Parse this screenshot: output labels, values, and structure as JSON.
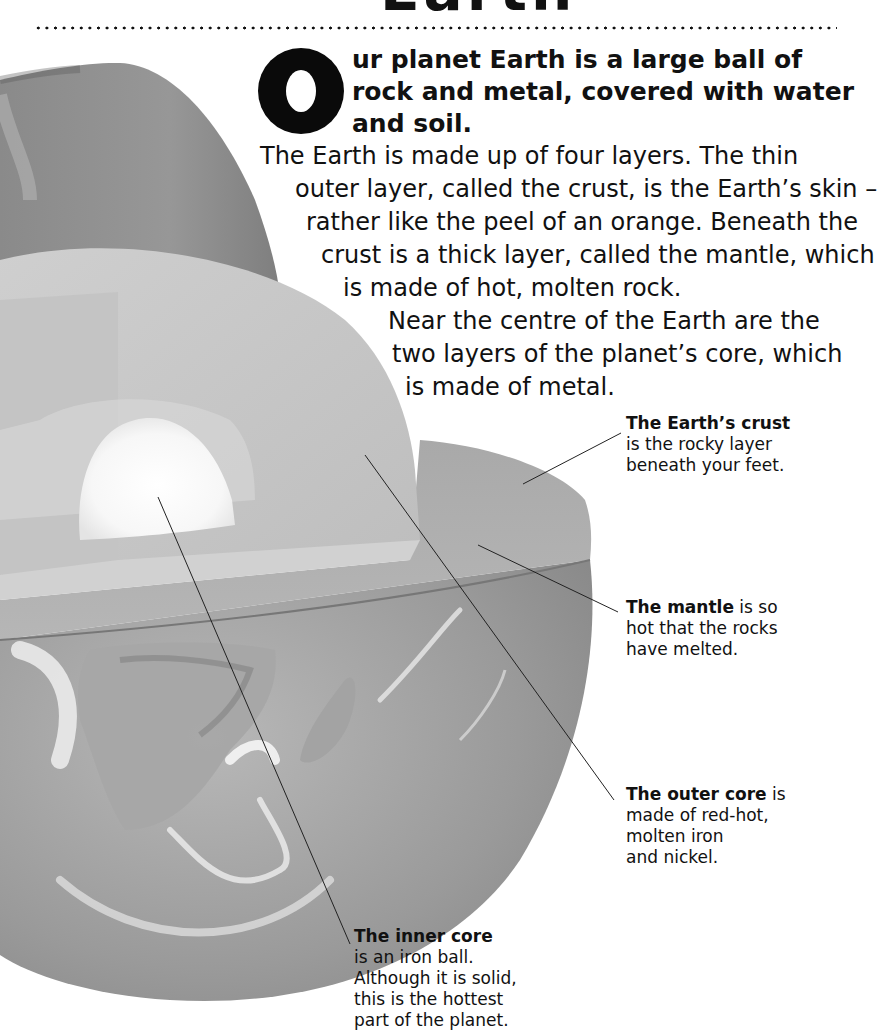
{
  "header": {
    "title_partial": "Earth"
  },
  "intro": {
    "drop_cap": "O",
    "lead_lines": [
      "ur planet Earth is a large ball of",
      "rock and metal, covered with water",
      "and soil."
    ],
    "body_lines": [
      "The Earth is made up of four layers. The thin",
      "outer layer, called the crust, is the Earth’s skin –",
      "rather like the peel of an orange. Beneath the",
      "crust is a thick layer, called the mantle, which",
      "is made of hot, molten rock.",
      "Near the centre of the Earth are the",
      "two layers of the planet’s core, which",
      "is made of metal."
    ]
  },
  "labels": {
    "crust": {
      "title": "The Earth’s crust",
      "lines": [
        "is the rocky layer",
        "beneath your feet."
      ]
    },
    "mantle": {
      "title": "The mantle",
      "title_suffix": " is so",
      "lines": [
        "hot that the rocks",
        "have melted."
      ]
    },
    "outer_core": {
      "title": "The outer core",
      "title_suffix": " is",
      "lines": [
        "made of red-hot,",
        "molten iron",
        "and nickel."
      ]
    },
    "inner_core": {
      "title": "The inner core",
      "lines": [
        "is an iron ball.",
        "Although it is solid,",
        "this is the hottest",
        "part of the planet."
      ]
    }
  },
  "colors": {
    "text": "#111111",
    "crust_shell": "#8f8f8f",
    "mantle_face": "#c9c9c9",
    "outer_core_face": "#dcdcdc",
    "inner_core": "#fafafa",
    "globe": "#9c9c9c"
  }
}
